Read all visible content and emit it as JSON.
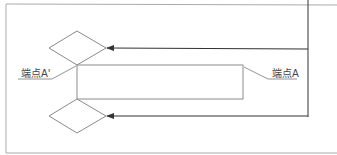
{
  "diagram": {
    "labels": {
      "endpoint_a_prime": "端点A'",
      "endpoint_a": "端点A"
    },
    "colors": {
      "frame": "#9a9a9a",
      "shape": "#8a8a8a",
      "arrow": "#333333",
      "text": "#444444"
    }
  }
}
